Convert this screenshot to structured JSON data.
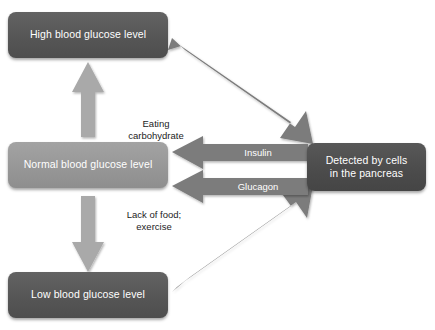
{
  "diagram": {
    "colors": {
      "box_dark": "#5a5a5a",
      "box_light": "#9a9a9a",
      "box_darkest": "#4f4f4f",
      "arrow_mid_gray": "#7b7b7b",
      "arrow_light_gray": "#a9a9a9",
      "arrow_label_text": "#ffffff",
      "flow_label_text": "#1c1c1c",
      "background": "#ffffff"
    },
    "nodes": [
      {
        "id": "high",
        "label": "High blood glucose level"
      },
      {
        "id": "normal",
        "label": "Normal blood glucose level"
      },
      {
        "id": "low",
        "label": "Low blood glucose level"
      },
      {
        "id": "pancreas",
        "label": "Detected by cells\nin the pancreas"
      }
    ],
    "flow_labels": [
      {
        "id": "eating",
        "label": "Eating\ncarbohydrate"
      },
      {
        "id": "lack",
        "label": "Lack of food;\nexercise"
      }
    ],
    "arrow_labels": [
      {
        "id": "insulin",
        "label": "Insulin"
      },
      {
        "id": "glucagon",
        "label": "Glucagon"
      }
    ],
    "arrows": [
      {
        "id": "normal-to-high",
        "direction": "up",
        "from": "normal",
        "to": "high"
      },
      {
        "id": "normal-to-low",
        "direction": "down",
        "from": "normal",
        "to": "low"
      },
      {
        "id": "high-to-pancreas",
        "direction": "down-right",
        "from": "high",
        "to": "pancreas"
      },
      {
        "id": "low-to-pancreas",
        "direction": "up-right",
        "from": "low",
        "to": "pancreas"
      },
      {
        "id": "insulin-to-normal",
        "direction": "left",
        "from": "pancreas",
        "to": "normal"
      },
      {
        "id": "glucagon-to-normal",
        "direction": "left",
        "from": "pancreas",
        "to": "normal"
      }
    ]
  }
}
